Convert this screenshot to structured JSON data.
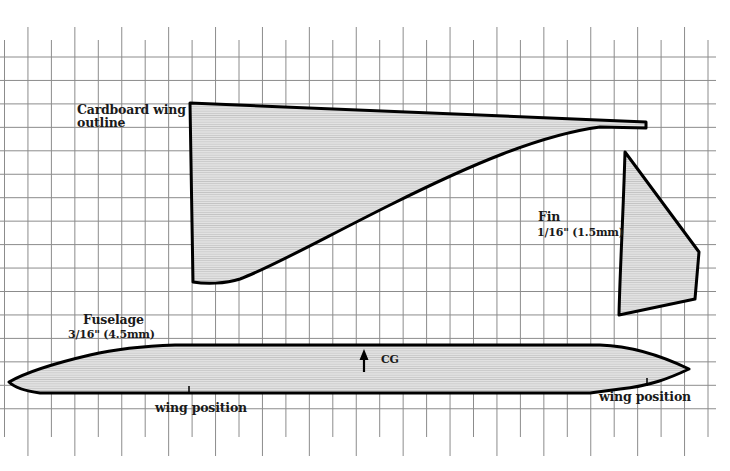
{
  "diagram": {
    "type": "paper-glider-template",
    "grid": {
      "spacing_px": 23.5,
      "line_color": "#8a8a8a"
    },
    "colors": {
      "outline": "#000000",
      "fill": "#dcdcdc",
      "hatch": "#bdbdbd"
    },
    "parts": {
      "wing": {
        "label_line1": "Cardboard wing",
        "label_line2": "outline"
      },
      "fin": {
        "label": "Fin",
        "thickness": "1/16\" (1.5mm)"
      },
      "fuselage": {
        "label": "Fuselage",
        "thickness": "3/16\" (4.5mm)"
      }
    },
    "markers": {
      "cg": {
        "label": "CG"
      },
      "wing_position_left": {
        "label": "wing position"
      },
      "wing_position_right": {
        "label": "wing position"
      }
    }
  }
}
